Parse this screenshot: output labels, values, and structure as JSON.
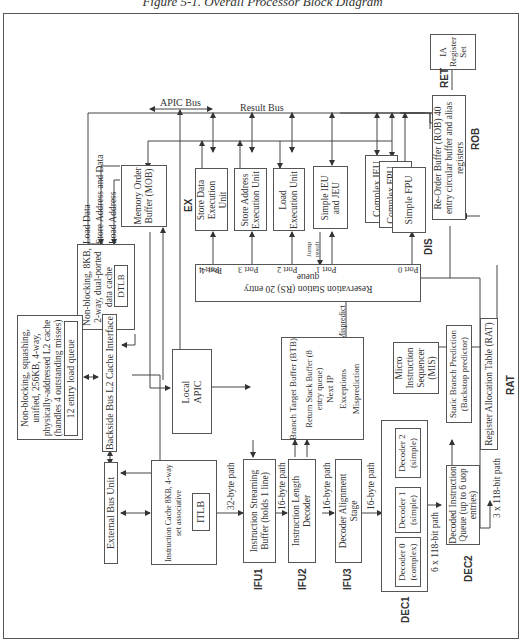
{
  "figure": {
    "title": "Figure 5-1. Overall Processor Block Diagram",
    "orientation": "rotated 90 degrees counter-clockwise"
  },
  "buses": {
    "apic_bus": "APIC Bus",
    "result_bus": "Result Bus"
  },
  "blocks": {
    "ia_register_set": "IA Register Set",
    "rob": "Re-Order Buffer (ROB) 40 entry circular buffer and alias registers",
    "mob": "Memory Order Buffer (MOB)",
    "store_data_eu": "Store Data Execution Unit",
    "store_address_eu": "Store Address Execution Unit",
    "load_eu": "Load Execution Unit",
    "simple_ieu_jeu": "Simple IEU and JEU",
    "complex_ieu": "Complex IEU",
    "complex_fpu": "Complex FPU",
    "simple_fpu": "Simple FPU",
    "data_cache": "Non-blocking, 8KB, 2-way, dual-ported data cache",
    "dtlb": "DTLB",
    "l2_cache": "Non-blocking, squashing, unified, 256KB, 4-way, physically-addressed L2 cache (handles 4 outstanding misses)",
    "load_queue": "12 entry load queue",
    "backside_bus": "Backside Bus L2 Cache Interface",
    "external_bus_unit": "External Bus Unit",
    "instruction_cache": "Instruction Cache 8KB, 4-way set associative",
    "itlb": "ITLB",
    "local_apic": "Local APIC",
    "reservation_station": "Reservation Station (RS) 20 entry queue",
    "btb": "Branch Target Buffer (BTB)",
    "return_stack": "Return Stack Buffer (8 entry queue)",
    "next_ip": "Next IP",
    "exceptions": "Exceptions",
    "misprediction": "Misprediction",
    "isb": "Instruction Streaming Buffer (holds 1 line)",
    "ild": "Instruction Length Decoder",
    "das": "Decoder Alignment Stage",
    "decoder0": "Decoder 0 (complex)",
    "decoder1": "Decoder 1 (simple)",
    "decoder2": "Decoder 2 (simple)",
    "mis": "Micro Instruction Sequencer (MIS)",
    "diq": "Decoded Instruction Queue (up to 6 uop entries)",
    "sbp": "Static Branch Prediction (Backstop predictor)",
    "rat": "Register Allocation Table (RAT)"
  },
  "ports": [
    "Port 4",
    "Port 3",
    "Port 2",
    "Port 1",
    "Port 0"
  ],
  "signals": {
    "load_data": "Load Data",
    "store_addr_data": "Store Address and Data",
    "load_address": "Load Address",
    "jump_result": "Jump result",
    "mispredict": "Mispredict",
    "path32": "32-byte path",
    "path16a": "16-byte path",
    "path16b": "16-byte path",
    "path16c": "16-byte path",
    "path6x118": "6 x 118-bit path",
    "path3x118": "3 x 118-bit path"
  },
  "stages": {
    "ret": "RET",
    "rob": "ROB",
    "ex": "EX",
    "dis": "DIS",
    "rat": "RAT",
    "ifu1": "IFU1",
    "ifu2": "IFU2",
    "ifu3": "IFU3",
    "dec1": "DEC1",
    "dec2": "DEC2"
  }
}
